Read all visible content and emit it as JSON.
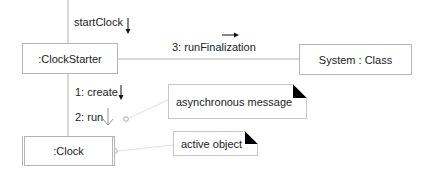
{
  "diagram": {
    "type": "UML communication diagram",
    "objects": [
      {
        "id": "clockstarter",
        "label": ":ClockStarter"
      },
      {
        "id": "system",
        "label": "System : Class"
      },
      {
        "id": "clock",
        "label": ":Clock",
        "active": true
      }
    ],
    "messages": [
      {
        "label": "startClock",
        "arrow": "solid-down"
      },
      {
        "label": "3: runFinalization",
        "arrow": "solid-right"
      },
      {
        "label": "1: create",
        "arrow": "solid-down"
      },
      {
        "label": "2: run",
        "arrow": "open-down"
      }
    ],
    "notes": [
      {
        "label": "asynchronous message"
      },
      {
        "label": "active object"
      }
    ],
    "colors": {
      "line": "#b0b0b0",
      "border": "#b5b5b5",
      "arrow": "#111111",
      "note_corner": "#000000"
    }
  }
}
